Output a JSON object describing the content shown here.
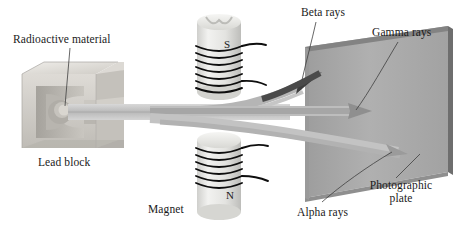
{
  "figure": {
    "background_color": "#ffffff"
  },
  "labels": {
    "radioactive_material": "Radioactive material",
    "lead_block": "Lead block",
    "magnet": "Magnet",
    "beta_rays": "Beta rays",
    "gamma_rays": "Gamma rays",
    "alpha_rays": "Alpha rays",
    "photographic_plate": "Photographic plate",
    "pole_south": "S",
    "pole_north": "N"
  },
  "colors": {
    "text": "#1a1a1a",
    "plate_face": "#a9a9a9",
    "plate_top_edge": "#7d7d7d",
    "plate_right_edge": "#6f6f6f",
    "beam": "#c2c2c2",
    "beta_arrow": "#3a3a3a",
    "gamma_arrow": "#8c8c8c",
    "alpha_arrow": "#9a9a9a",
    "lead_block": "#cfcfcb",
    "magnet_body": "#e2e2e0",
    "coil_wire": "#111111",
    "leader_line": "#4a4a4a"
  },
  "elements": {
    "lead_block_description": "Cut-away lead block with cylindrical cavity holding the sample",
    "magnet_top_pole": "S",
    "magnet_bottom_pole": "N",
    "coil_turns": 7,
    "ray_count": 3,
    "ray_names": [
      "Beta rays",
      "Gamma rays",
      "Alpha rays"
    ],
    "beta_deflection": "upward",
    "gamma_deflection": "none (straight)",
    "alpha_deflection": "downward"
  }
}
